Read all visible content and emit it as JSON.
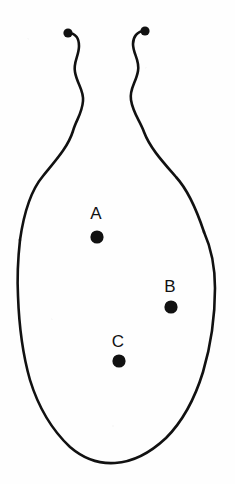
{
  "figure": {
    "kind": "line-drawing",
    "background_color": "#fefefe",
    "ink_color": "#111111",
    "stroke_width": 2.6,
    "canvas": {
      "width": 235,
      "height": 484
    },
    "markers": [
      {
        "id": "A",
        "label": "A",
        "label_x": 96,
        "label_y": 219,
        "dot_x": 97,
        "dot_y": 237,
        "dot_r": 6.6
      },
      {
        "id": "B",
        "label": "B",
        "label_x": 170,
        "label_y": 292,
        "dot_x": 171,
        "dot_y": 307,
        "dot_r": 6.6
      },
      {
        "id": "C",
        "label": "C",
        "label_x": 118,
        "label_y": 347,
        "dot_x": 119,
        "dot_y": 361,
        "dot_r": 6.6
      }
    ],
    "tentacles": [
      {
        "id": "left",
        "tip_bulb_x": 68,
        "tip_bulb_y": 33,
        "tip_bulb_r": 4.6,
        "path": "M 68 33 C 76 33 79 39 79 46 C 79 56 73 62 75 72 C 77 84 84 90 83 101 C 82 114 76 120 73 131 C 68 147 56 160 43 176 C 32 189 24 212 20 240"
      },
      {
        "id": "right",
        "tip_bulb_x": 145,
        "tip_bulb_y": 31,
        "tip_bulb_r": 4.6,
        "path": "M 145 31 C 137 31 133 37 133 44 C 133 54 140 60 138 71 C 136 83 129 89 131 100 C 133 113 140 121 144 132 C 150 148 163 162 176 177 C 188 190 196 208 204 232"
      }
    ],
    "body_outline_path": "M 20 240 C 18 258 17 276 18 296 C 19 324 22 352 30 380 C 38 406 52 430 70 447 C 84 459 100 464 115 463 C 132 462 150 453 166 438 C 183 421 195 398 203 372 C 211 345 215 315 215 288 C 215 268 212 250 204 232"
  }
}
